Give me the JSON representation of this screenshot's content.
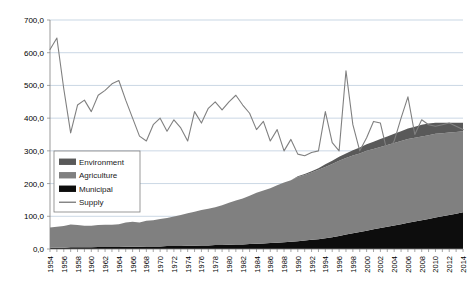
{
  "chart_data": {
    "type": "area",
    "title": "",
    "subtitle": "",
    "xlabel": "",
    "ylabel": "",
    "stacked": true,
    "grid": true,
    "legend_position": "inside-left",
    "ylim": [
      0,
      700
    ],
    "ytick_step": 100,
    "ytick_labels": [
      "0,0",
      "100,0",
      "200,0",
      "300,0",
      "400,0",
      "500,0",
      "600,0",
      "700,0"
    ],
    "xlim": [
      1954,
      2014
    ],
    "xtick_step": 1,
    "xlabel_step": 2,
    "x": [
      1954,
      1955,
      1956,
      1957,
      1958,
      1959,
      1960,
      1961,
      1962,
      1963,
      1964,
      1965,
      1966,
      1967,
      1968,
      1969,
      1970,
      1971,
      1972,
      1973,
      1974,
      1975,
      1976,
      1977,
      1978,
      1979,
      1980,
      1981,
      1982,
      1983,
      1984,
      1985,
      1986,
      1987,
      1988,
      1989,
      1990,
      1991,
      1992,
      1993,
      1994,
      1995,
      1996,
      1997,
      1998,
      1999,
      2000,
      2001,
      2002,
      2003,
      2004,
      2005,
      2006,
      2007,
      2008,
      2009,
      2010,
      2011,
      2012,
      2013,
      2014
    ],
    "xtick_labels": [
      "1954",
      "1956",
      "1958",
      "1960",
      "1962",
      "1964",
      "1966",
      "1968",
      "1970",
      "1972",
      "1974",
      "1976",
      "1978",
      "1980",
      "1982",
      "1984",
      "1986",
      "1988",
      "1990",
      "1992",
      "1994",
      "1996",
      "1998",
      "2000",
      "2002",
      "2004",
      "2006",
      "2008",
      "2010",
      "2012",
      "2014"
    ],
    "series": [
      {
        "name": "Municipal",
        "color": "#0d0d0d",
        "kind": "area",
        "values": [
          4,
          4,
          4,
          5,
          5,
          5,
          5,
          6,
          6,
          6,
          6,
          7,
          7,
          7,
          8,
          8,
          8,
          9,
          9,
          9,
          10,
          10,
          11,
          11,
          12,
          12,
          13,
          14,
          14,
          15,
          16,
          17,
          18,
          19,
          21,
          22,
          24,
          26,
          28,
          30,
          33,
          36,
          40,
          44,
          48,
          52,
          56,
          60,
          64,
          68,
          72,
          76,
          80,
          84,
          88,
          92,
          96,
          100,
          104,
          108,
          112
        ]
      },
      {
        "name": "Agriculture",
        "color": "#808080",
        "kind": "area",
        "values": [
          62,
          64,
          66,
          70,
          68,
          66,
          66,
          67,
          68,
          68,
          70,
          74,
          76,
          74,
          78,
          80,
          84,
          86,
          90,
          95,
          99,
          104,
          108,
          112,
          116,
          122,
          128,
          134,
          140,
          148,
          156,
          162,
          168,
          176,
          182,
          188,
          196,
          200,
          206,
          212,
          218,
          224,
          230,
          234,
          238,
          240,
          244,
          246,
          248,
          250,
          252,
          254,
          256,
          256,
          256,
          256,
          256,
          254,
          252,
          250,
          248
        ]
      },
      {
        "name": "Environment",
        "color": "#595959",
        "kind": "area",
        "values": [
          0,
          0,
          0,
          0,
          0,
          0,
          0,
          0,
          0,
          0,
          0,
          0,
          0,
          0,
          0,
          0,
          0,
          0,
          0,
          0,
          0,
          0,
          0,
          0,
          0,
          0,
          0,
          0,
          0,
          0,
          0,
          0,
          0,
          0,
          0,
          0,
          2,
          3,
          4,
          5,
          8,
          10,
          12,
          14,
          16,
          18,
          20,
          22,
          24,
          26,
          28,
          30,
          32,
          34,
          36,
          36,
          34,
          32,
          30,
          28,
          26
        ]
      },
      {
        "name": "Supply",
        "color": "#808080",
        "kind": "line",
        "values": [
          610,
          645,
          490,
          355,
          440,
          455,
          420,
          470,
          485,
          505,
          515,
          455,
          400,
          345,
          330,
          380,
          400,
          360,
          395,
          370,
          330,
          420,
          385,
          430,
          450,
          425,
          450,
          470,
          440,
          415,
          365,
          390,
          330,
          365,
          300,
          335,
          290,
          285,
          295,
          300,
          420,
          325,
          300,
          545,
          380,
          300,
          340,
          390,
          385,
          295,
          330,
          400,
          465,
          350,
          395,
          380,
          375,
          380,
          385,
          375,
          365
        ]
      }
    ],
    "legend": [
      {
        "label": "Environment",
        "color": "#595959",
        "marker": "swatch"
      },
      {
        "label": "Agriculture",
        "color": "#808080",
        "marker": "swatch"
      },
      {
        "label": "Municipal",
        "color": "#0d0d0d",
        "marker": "swatch"
      },
      {
        "label": "Supply",
        "color": "#808080",
        "marker": "line"
      }
    ]
  },
  "colors": {
    "background": "#ffffff",
    "gridline": "#b3c6d9",
    "axis": "#808080",
    "text": "#000000"
  }
}
